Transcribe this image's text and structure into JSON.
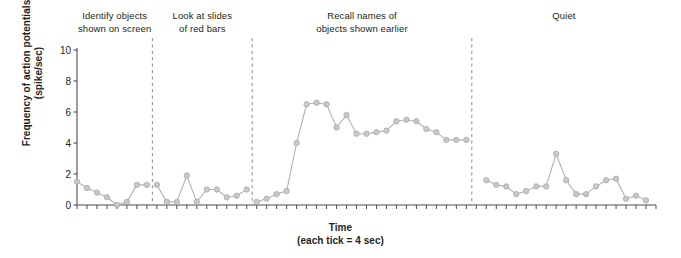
{
  "figure": {
    "ylabel": "Frequency of action potentials\n(spike/sec)",
    "xlabel": "Time\n(each tick = 4 sec)",
    "phases": [
      {
        "label": "Identify objects\nshown on screen"
      },
      {
        "label": "Look at slides\nof red bars"
      },
      {
        "label": "Recall names of\nobjects shown earlier"
      },
      {
        "label": "Quiet"
      }
    ]
  },
  "chart_data": {
    "type": "line",
    "title": "",
    "xlabel": "Time (each tick = 4 sec)",
    "ylabel": "Frequency of action potentials (spike/sec)",
    "ylim": [
      0,
      10
    ],
    "yticks": [
      0,
      2,
      4,
      6,
      8,
      10
    ],
    "ytick_labels": [
      "0",
      "2",
      "4",
      "6",
      "8",
      "10"
    ],
    "grid": false,
    "legend": false,
    "xtick_interval_seconds": 4,
    "marker": "circle",
    "marker_color": "#c9c9c9",
    "line_color": "#b5b5b5",
    "phase_dividers_x": [
      8,
      18,
      40
    ],
    "phases": [
      {
        "name": "Identify objects shown on screen",
        "x": [
          0,
          1,
          2,
          3,
          4,
          5,
          6,
          7
        ],
        "values": [
          1.5,
          1.1,
          0.8,
          0.5,
          0.0,
          0.2,
          1.3,
          1.3
        ]
      },
      {
        "name": "Look at slides of red bars",
        "x": [
          8,
          9,
          10,
          11,
          12,
          13,
          14,
          15,
          16,
          17
        ],
        "values": [
          1.3,
          0.2,
          0.2,
          1.9,
          0.2,
          1.0,
          1.0,
          0.5,
          0.6,
          1.0
        ]
      },
      {
        "name": "Recall names of objects shown earlier",
        "x": [
          18,
          19,
          20,
          21,
          22,
          23,
          24,
          25,
          26,
          27,
          28,
          29,
          30,
          31,
          32,
          33,
          34,
          35,
          36,
          37,
          38,
          39
        ],
        "values": [
          0.2,
          0.4,
          0.7,
          0.9,
          4.0,
          6.5,
          6.6,
          6.5,
          5.0,
          5.8,
          4.6,
          4.6,
          4.7,
          4.8,
          5.4,
          5.5,
          5.4,
          4.9,
          4.7,
          4.2,
          4.2,
          4.2
        ]
      },
      {
        "name": "Quiet",
        "x": [
          41,
          42,
          43,
          44,
          45,
          46,
          47,
          48,
          49,
          50,
          51,
          52,
          53,
          54,
          55,
          56,
          57
        ],
        "values": [
          1.6,
          1.3,
          1.2,
          0.7,
          0.9,
          1.2,
          1.2,
          3.3,
          1.6,
          0.7,
          0.7,
          1.2,
          1.6,
          1.7,
          0.4,
          0.6,
          0.3
        ]
      }
    ],
    "annotations": [
      {
        "text": "peak spike at end of recall phase",
        "value": 9.1
      }
    ]
  }
}
